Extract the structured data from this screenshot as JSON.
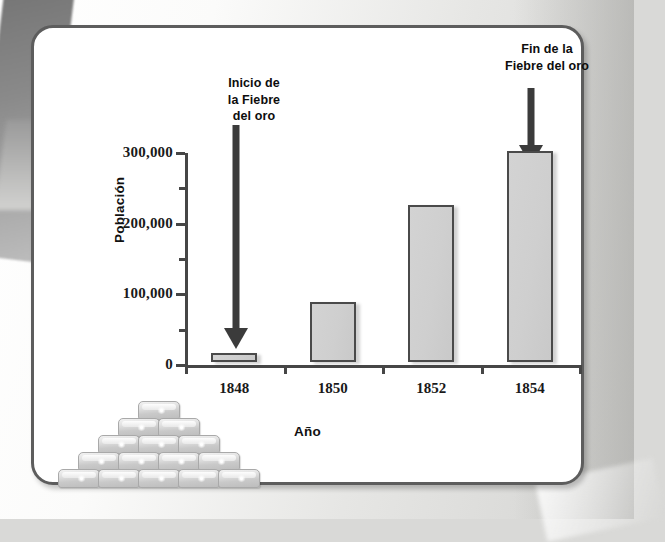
{
  "figure": {
    "panel_name": "chart-panel"
  },
  "chart_data": {
    "type": "bar",
    "title": "",
    "categories": [
      "1848",
      "1850",
      "1852",
      "1854"
    ],
    "values": [
      13000,
      85000,
      222000,
      298000
    ],
    "xlabel": "Año",
    "ylabel": "Población",
    "ylim": [
      0,
      300000
    ],
    "ytick_labels": [
      "0",
      "100,000",
      "200,000",
      "300,000"
    ],
    "ytick_values": [
      0,
      100000,
      200000,
      300000
    ],
    "yminor_tick_values": [
      50000,
      150000,
      250000
    ],
    "grid": false,
    "legend": false,
    "bar_color": "#cfcfcf",
    "bar_edge_color": "#4a4a4a",
    "annotations": [
      {
        "id": "inicio",
        "text": "Inicio de\nla Fiebre\ndel oro",
        "points_to_category": "1848",
        "arrow": "down"
      },
      {
        "id": "fin",
        "text": "Fin de la\nFiebre del oro",
        "points_to_category": "1854",
        "arrow": "down"
      }
    ],
    "illustration": {
      "name": "gold-bar-stack",
      "rows": [
        1,
        2,
        3,
        4,
        5
      ]
    }
  }
}
